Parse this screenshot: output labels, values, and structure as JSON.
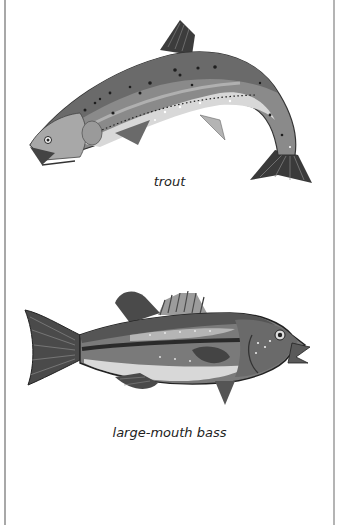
{
  "page": {
    "figures": [
      {
        "id": "trout",
        "caption": "trout",
        "icon": "trout-illustration"
      },
      {
        "id": "bass",
        "caption": "large-mouth bass",
        "icon": "large-mouth-bass-illustration"
      }
    ]
  },
  "colors": {
    "border": "#a8a8a8",
    "fish_dark": "#3a3a3a",
    "fish_mid": "#7a7a7a",
    "fish_light": "#d6d6d6",
    "caption": "#222222"
  }
}
